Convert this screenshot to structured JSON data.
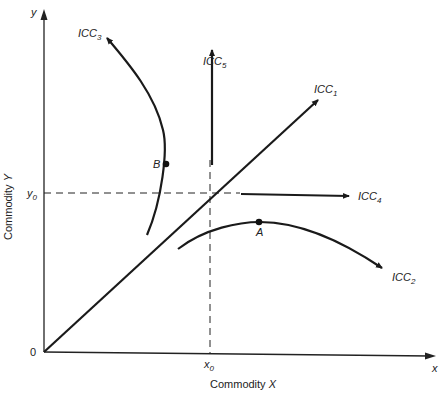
{
  "figure": {
    "axes": {
      "x_axis_title": "Commodity X",
      "y_axis_title": "Commodity Y",
      "x_axis_end_label": "x",
      "y_axis_end_label": "y",
      "origin_label": "0",
      "x0_label": "x",
      "x0_sub": "0",
      "y0_label": "y",
      "y0_sub": "0"
    },
    "curves": [
      {
        "id": "ICC1",
        "label": "ICC",
        "sub": "1",
        "shape": "straight ray from origin"
      },
      {
        "id": "ICC2",
        "label": "ICC",
        "sub": "2",
        "shape": "concave arc peaking at A"
      },
      {
        "id": "ICC3",
        "label": "ICC",
        "sub": "3",
        "shape": "backward-bending arc through B"
      },
      {
        "id": "ICC4",
        "label": "ICC",
        "sub": "4",
        "shape": "horizontal ray at y0"
      },
      {
        "id": "ICC5",
        "label": "ICC",
        "sub": "5",
        "shape": "vertical ray at x0"
      }
    ],
    "points": [
      {
        "id": "A",
        "label": "A"
      },
      {
        "id": "B",
        "label": "B"
      }
    ]
  }
}
